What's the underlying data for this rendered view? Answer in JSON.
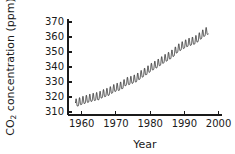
{
  "chart_data": {
    "type": "line",
    "title": "",
    "subtitle": "",
    "xlabel": "Year",
    "ylabel": "CO2 concentration (ppm)",
    "ylabel_parts": {
      "prefix": "CO",
      "subscript": "2",
      "suffix": " concentration (ppm)"
    },
    "xlim": [
      1956,
      2001
    ],
    "ylim": [
      308,
      372
    ],
    "xticks": [
      1960,
      1970,
      1980,
      1990,
      2000
    ],
    "xtick_labels": [
      "1960",
      "1970",
      "1980",
      "1990",
      "2000"
    ],
    "yticks": [
      310,
      320,
      330,
      340,
      350,
      360,
      370
    ],
    "ytick_labels": [
      "310",
      "320",
      "330",
      "340",
      "350",
      "360",
      "370"
    ],
    "grid": false,
    "legend": null,
    "legend_position": "none",
    "line_color": "#262626",
    "axis_color": "#1a1a1a",
    "background_color": "#ffffff",
    "series": [
      {
        "name": "Mauna Loa monthly mean CO2",
        "description": "Keeling Curve: rising annual mean with superimposed seasonal sawtooth oscillation of about 6 ppm peak-to-peak",
        "x_start": 1958.2,
        "x_end": 1997.0,
        "annual_mean_x": [
          1958,
          1959,
          1960,
          1961,
          1962,
          1963,
          1964,
          1965,
          1966,
          1967,
          1968,
          1969,
          1970,
          1971,
          1972,
          1973,
          1974,
          1975,
          1976,
          1977,
          1978,
          1979,
          1980,
          1981,
          1982,
          1983,
          1984,
          1985,
          1986,
          1987,
          1988,
          1989,
          1990,
          1991,
          1992,
          1993,
          1994,
          1995,
          1996,
          1997
        ],
        "annual_mean_y": [
          315.3,
          315.9,
          316.9,
          317.6,
          318.4,
          319.0,
          319.6,
          320.0,
          321.4,
          322.2,
          323.0,
          324.6,
          325.7,
          326.3,
          327.5,
          329.7,
          330.2,
          331.1,
          332.0,
          333.8,
          335.4,
          336.8,
          338.7,
          340.1,
          341.4,
          343.0,
          344.6,
          346.0,
          347.4,
          349.2,
          351.6,
          353.1,
          354.4,
          355.6,
          356.4,
          357.1,
          358.8,
          360.8,
          362.6,
          363.8
        ],
        "seasonal_amplitude": 3.1,
        "seasonal_period_years": 1.0,
        "seasonal_peak_month_fraction": 0.37
      }
    ]
  },
  "figure": {
    "plot_area": {
      "left": 68,
      "right": 222,
      "top": 19,
      "bottom": 115
    },
    "tick_length": 4,
    "tick_inward": true
  }
}
